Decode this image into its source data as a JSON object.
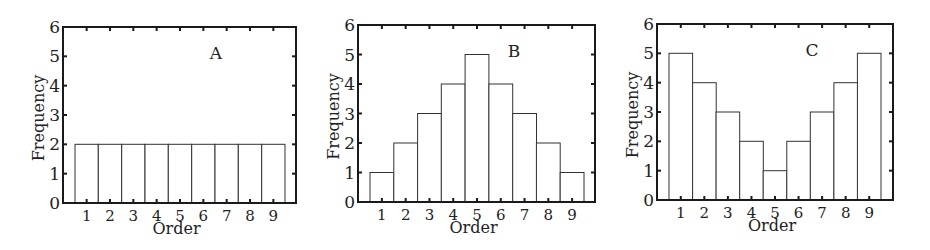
{
  "chart_data": [
    {
      "type": "bar",
      "panel_label": "A",
      "title": "",
      "xlabel": "Order",
      "ylabel": "Frequency",
      "categories": [
        "1",
        "2",
        "3",
        "4",
        "5",
        "6",
        "7",
        "8",
        "9"
      ],
      "values": [
        2,
        2,
        2,
        2,
        2,
        2,
        2,
        2,
        2
      ],
      "ylim": [
        0,
        6
      ],
      "yticks": [
        0,
        1,
        2,
        3,
        4,
        5,
        6
      ],
      "grid": false,
      "legend": null
    },
    {
      "type": "bar",
      "panel_label": "B",
      "title": "",
      "xlabel": "Order",
      "ylabel": "Frequency",
      "categories": [
        "1",
        "2",
        "3",
        "4",
        "5",
        "6",
        "7",
        "8",
        "9"
      ],
      "values": [
        1,
        2,
        3,
        4,
        5,
        4,
        3,
        2,
        1
      ],
      "ylim": [
        0,
        6
      ],
      "yticks": [
        0,
        1,
        2,
        3,
        4,
        5,
        6
      ],
      "grid": false,
      "legend": null
    },
    {
      "type": "bar",
      "panel_label": "C",
      "title": "",
      "xlabel": "Order",
      "ylabel": "Frequency",
      "categories": [
        "1",
        "2",
        "3",
        "4",
        "5",
        "6",
        "7",
        "8",
        "9"
      ],
      "values": [
        5,
        4,
        3,
        2,
        1,
        2,
        3,
        4,
        5
      ],
      "ylim": [
        0,
        6
      ],
      "yticks": [
        0,
        1,
        2,
        3,
        4,
        5,
        6
      ],
      "grid": false,
      "legend": null
    }
  ],
  "layout": {
    "panels": [
      {
        "left": 63,
        "right": 296,
        "top": 27,
        "bottom": 203,
        "bar_start": 75,
        "bar_end": 285,
        "label_x": 216,
        "label_y": 59
      },
      {
        "left": 358,
        "right": 595,
        "top": 25,
        "bottom": 202,
        "bar_start": 370,
        "bar_end": 584,
        "label_x": 514,
        "label_y": 57
      },
      {
        "left": 657,
        "right": 893,
        "top": 24,
        "bottom": 200,
        "bar_start": 669,
        "bar_end": 881,
        "label_x": 812,
        "label_y": 56
      }
    ],
    "colors": {
      "frame": "#1a1a1a",
      "bar_fill": "#ffffff",
      "bar_stroke": "#333333",
      "text": "#222222"
    }
  }
}
